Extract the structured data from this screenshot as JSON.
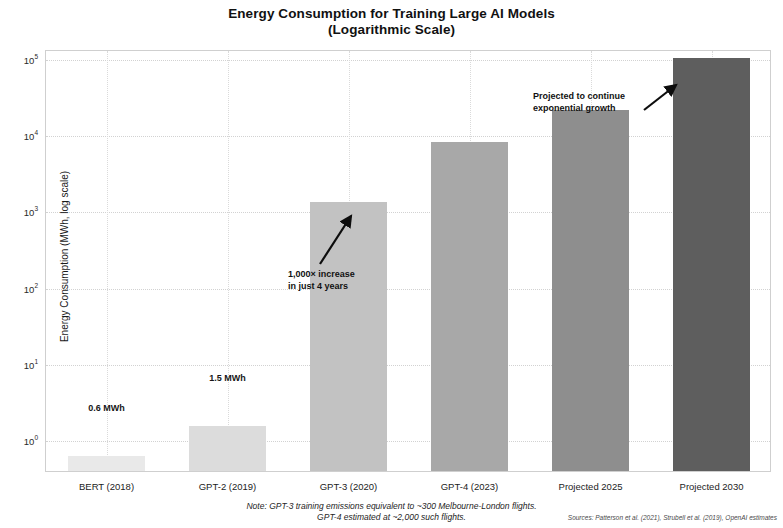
{
  "chart_data": {
    "type": "bar",
    "title": "Energy Consumption for Training Large AI Models",
    "subtitle": "(Logarithmic Scale)",
    "xlabel": "",
    "ylabel": "Energy Consumption (MWh, log scale)",
    "yscale": "log",
    "ylim": [
      0.3,
      160000
    ],
    "grid": true,
    "legend": false,
    "categories": [
      "BERT (2018)",
      "GPT-2 (2019)",
      "GPT-3 (2020)",
      "GPT-4 (2023)",
      "Projected 2025",
      "Projected 2030"
    ],
    "values": [
      0.6,
      1.5,
      1287,
      7800,
      21000,
      100000
    ],
    "bar_colors": [
      "#e9e9e9",
      "#dcdcdc",
      "#c2c2c2",
      "#a8a8a8",
      "#8e8e8e",
      "#5e5e5e"
    ],
    "value_labels": [
      "0.6 MWh",
      "1.5 MWh",
      "",
      "",
      "",
      ""
    ],
    "ytick_bases": [
      "10",
      "10",
      "10",
      "10",
      "10",
      "10"
    ],
    "ytick_exponents": [
      "5",
      "4",
      "3",
      "2",
      "1",
      "0"
    ],
    "ytick_values": [
      100000,
      10000,
      1000,
      100,
      10,
      1
    ],
    "annotations": [
      {
        "id": "growth-annotation",
        "line1": "1,000× increase",
        "line2": "in just 4 years"
      },
      {
        "id": "projection-annotation",
        "line1": "Projected to continue",
        "line2": "exponential growth"
      }
    ],
    "note_line1": "Note: GPT-3 training emissions equivalent to ~300 Melbourne-London flights.",
    "note_line2": "GPT-4 estimated at ~2,000 such flights.",
    "sources": "Sources: Patterson et al. (2021), Strubell et al. (2019), OpenAI estimates"
  }
}
